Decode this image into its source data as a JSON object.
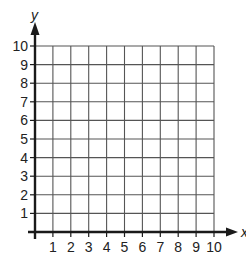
{
  "chart_data": {
    "type": "scatter",
    "title": "",
    "xlabel": "x",
    "ylabel": "y",
    "xlim": [
      0,
      10
    ],
    "ylim": [
      0,
      10
    ],
    "x_ticks": [
      "1",
      "2",
      "3",
      "4",
      "5",
      "6",
      "7",
      "8",
      "9",
      "10"
    ],
    "y_ticks": [
      "1",
      "2",
      "3",
      "4",
      "5",
      "6",
      "7",
      "8",
      "9",
      "10"
    ],
    "grid": true,
    "grid_step": 1,
    "series": [],
    "legend": null
  },
  "colors": {
    "grid": "#555555",
    "axis": "#1a1a1a",
    "background": "#ffffff"
  },
  "layout": {
    "origin_px": [
      35,
      232
    ],
    "unit_px_x": 17.9,
    "unit_px_y": 18.6
  }
}
